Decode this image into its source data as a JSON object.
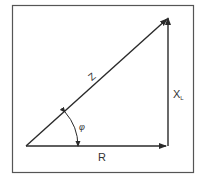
{
  "diagram": {
    "labels": {
      "hypotenuse": "Z",
      "vertical": "X",
      "vertical_subscript": "L",
      "horizontal": "R",
      "angle": "φ"
    },
    "colors": {
      "line": "#2a2a2a",
      "border": "#555555",
      "background": "#ffffff"
    }
  }
}
